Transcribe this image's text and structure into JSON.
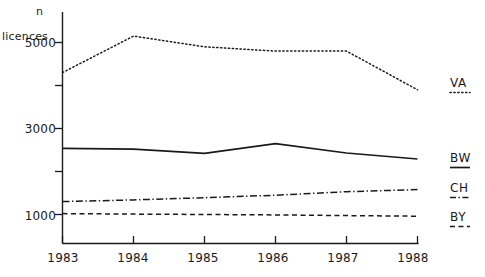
{
  "chart_data": {
    "type": "line",
    "title": "",
    "subtitle": "",
    "xlabel": "",
    "ylabel": "licences",
    "yunit": "n",
    "x": [
      "1983",
      "1984",
      "1985",
      "1986",
      "1987",
      "1988"
    ],
    "categories": [
      "1983",
      "1984",
      "1985",
      "1986",
      "1987",
      "1988"
    ],
    "xlim": [
      1983,
      1988
    ],
    "ylim": [
      0,
      5600
    ],
    "grid": false,
    "legend_position": "right",
    "yticks_major": [
      "1000",
      "3000",
      "5000"
    ],
    "ytick_values_major": [
      1000,
      3000,
      5000
    ],
    "ytick_values_minor": [
      2000,
      4000
    ],
    "series": [
      {
        "name": "VA",
        "style": "dotted",
        "color": "#1a1a1a",
        "values": [
          4300,
          5150,
          4900,
          4800,
          4800,
          3900
        ]
      },
      {
        "name": "BW",
        "style": "solid",
        "color": "#1a1a1a",
        "values": [
          2540,
          2520,
          2420,
          2650,
          2430,
          2290
        ]
      },
      {
        "name": "CH",
        "style": "dashdot",
        "color": "#1a1a1a",
        "values": [
          1300,
          1340,
          1390,
          1450,
          1530,
          1580
        ]
      },
      {
        "name": "BY",
        "style": "dashed",
        "color": "#1a1a1a",
        "values": [
          1020,
          1010,
          1000,
          990,
          975,
          960
        ]
      }
    ]
  },
  "axis": {
    "unit_label": "n",
    "y_title": "licences",
    "ytick_5000": "5000",
    "ytick_3000": "3000",
    "ytick_1000": "1000",
    "xtick_1983": "1983",
    "xtick_1984": "1984",
    "xtick_1985": "1985",
    "xtick_1986": "1986",
    "xtick_1987": "1987",
    "xtick_1988": "1988"
  },
  "legend": {
    "items": [
      {
        "label": "VA",
        "style": "dotted"
      },
      {
        "label": "BW",
        "style": "solid"
      },
      {
        "label": "CH",
        "style": "dashdot"
      },
      {
        "label": "BY",
        "style": "dashed"
      }
    ]
  },
  "colors": {
    "ink": "#1a1a1a",
    "background": "#ffffff"
  }
}
